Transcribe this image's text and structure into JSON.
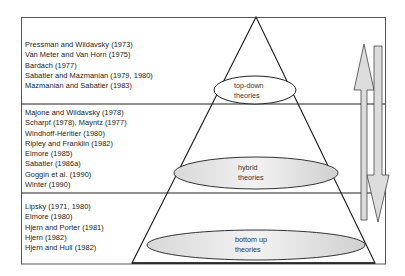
{
  "diagram": {
    "type": "pyramid",
    "tiers": [
      {
        "name": "top-down",
        "label_line1": "top-down",
        "label_line2": "theories",
        "ellipse_fill": "#ffffff",
        "authors": [
          "Pressman and Wildavsky (1973)",
          "Van Meter and Van Horn (1975)",
          "Bardach (1977)",
          "Sabatier and Mazmanian (1979, 1980)",
          "Mazmanian and Sabatier (1983)"
        ]
      },
      {
        "name": "hybrid",
        "label_line1": "hybrid",
        "label_line2": "theories",
        "ellipse_fill": "#e4e4e4",
        "authors": [
          "Majone and Wildavsky (1978)",
          "Scharpf (1978), Mayntz (1977)",
          "Windhoff-Héritier (1980)",
          "Ripley and Franklin (1982)",
          "Elmore (1985)",
          "Sabatier (1986a)",
          "Goggin et al. (1990)",
          "Winter (1990)"
        ]
      },
      {
        "name": "bottom-up",
        "label_line1": "bottom up",
        "label_line2": "theories",
        "ellipse_fill": "#e4e4e4",
        "authors": [
          "Lipsky (1971, 1980)",
          "Elmore (1980)",
          "Hjern and Porter (1981)",
          "Hjern (1982)",
          "Hjern and Hull (1982)"
        ]
      }
    ],
    "arrows": [
      {
        "direction": "up",
        "fill": "#dcdcdc"
      },
      {
        "direction": "down",
        "fill": "#dcdcdc"
      }
    ],
    "colors": {
      "line": "#1a1a1a",
      "frame": "#555555",
      "text": "#222222"
    }
  }
}
